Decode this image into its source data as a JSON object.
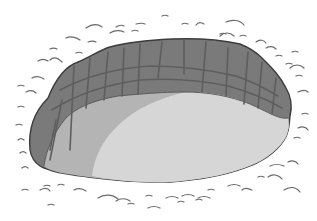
{
  "illustration": {
    "subject": "pit in the ground",
    "alt": "Grayscale illustration of an oval pit with brick-like walls, surrounded by grass tufts",
    "colors": {
      "background": "#ffffff",
      "outline": "#3c3c3c",
      "wall": "#7a7a7a",
      "wall_lines": "#5e5e5e",
      "floor_shadow": "#b4b4b4",
      "floor_light": "#d6d6d6",
      "grass": "#6a6a6a"
    }
  }
}
